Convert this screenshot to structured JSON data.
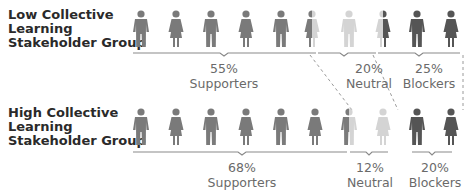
{
  "groups": [
    {
      "label_lines": [
        "Low Collective",
        "Learning",
        "Stakeholder Group"
      ],
      "segments": [
        {
          "percent": "55%",
          "name": "Supporters"
        },
        {
          "percent": "20%",
          "name": "Neutral"
        },
        {
          "percent": "25%",
          "name": "Blockers"
        }
      ]
    },
    {
      "label_lines": [
        "High Collective",
        "Learning",
        "Stakeholder Group"
      ],
      "segments": [
        {
          "percent": "68%",
          "name": "Supporters"
        },
        {
          "percent": "12%",
          "name": "Neutral"
        },
        {
          "percent": "20%",
          "name": "Blockers"
        }
      ]
    }
  ],
  "colors": {
    "supporter": "#7a7a7a",
    "neutral": "#d4d4d4",
    "blocker": "#555555",
    "text": "#6a6a6a",
    "label": "#2a2a2a"
  }
}
